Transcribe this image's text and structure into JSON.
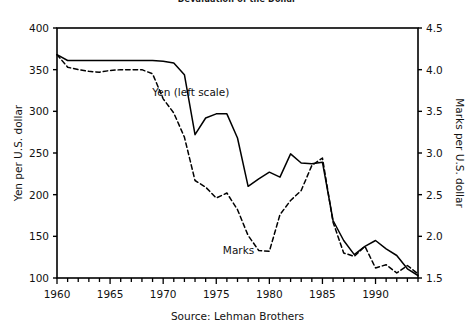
{
  "chart_data": {
    "type": "line",
    "title": "Devaluation of the Dollar",
    "source": "Source: Lehman Brothers",
    "xlabel": "",
    "xlim": [
      1960,
      1994
    ],
    "xticks": [
      1960,
      1965,
      1970,
      1975,
      1980,
      1985,
      1990
    ],
    "xtick_labels": [
      "1960",
      "1965",
      "1970",
      "1975",
      "1980",
      "1985",
      "1990"
    ],
    "minor_xtick_step": 1,
    "grid": false,
    "legend_position": "inline-annotations",
    "left_axis": {
      "label": "Yen per U.S. dollar",
      "ylim": [
        100,
        400
      ],
      "yticks": [
        100,
        150,
        200,
        250,
        300,
        350,
        400
      ],
      "ytick_labels": [
        "100",
        "150",
        "200",
        "250",
        "300",
        "350",
        "400"
      ]
    },
    "right_axis": {
      "label": "Marks per U.S. dollar",
      "ylim": [
        1.5,
        4.5
      ],
      "yticks": [
        1.5,
        2.0,
        2.5,
        3.0,
        3.5,
        4.0,
        4.5
      ],
      "ytick_labels": [
        "1.5",
        "2.0",
        "2.5",
        "3.0",
        "3.5",
        "4.0",
        "4.5"
      ]
    },
    "series": [
      {
        "name": "Yen (left scale)",
        "axis": "left",
        "style": "solid",
        "color": "#000000",
        "annotation": "Yen (left scale)",
        "annotation_x": 1972.6,
        "annotation_y": 318,
        "x": [
          1960,
          1961,
          1962,
          1963,
          1964,
          1965,
          1966,
          1967,
          1968,
          1969,
          1970,
          1971,
          1972,
          1973,
          1974,
          1975,
          1976,
          1977,
          1978,
          1979,
          1980,
          1981,
          1982,
          1983,
          1984,
          1985,
          1986,
          1987,
          1988,
          1989,
          1990,
          1991,
          1992,
          1993,
          1994
        ],
        "values": [
          368,
          361,
          361,
          361,
          361,
          361,
          361,
          361,
          361,
          361,
          360,
          358,
          344,
          272,
          292,
          297,
          297,
          268,
          210,
          219,
          227,
          221,
          249,
          238,
          237,
          239,
          169,
          145,
          128,
          138,
          145,
          135,
          127,
          111,
          103
        ]
      },
      {
        "name": "Marks",
        "axis": "right",
        "style": "dashed",
        "color": "#000000",
        "annotation": "Marks",
        "annotation_x": 1977.1,
        "annotation_y": 1.79,
        "x": [
          1960,
          1961,
          1962,
          1963,
          1964,
          1965,
          1966,
          1967,
          1968,
          1969,
          1970,
          1971,
          1972,
          1973,
          1974,
          1975,
          1976,
          1977,
          1978,
          1979,
          1980,
          1981,
          1982,
          1983,
          1984,
          1985,
          1986,
          1987,
          1988,
          1989,
          1990,
          1991,
          1992,
          1993,
          1994
        ],
        "values": [
          4.18,
          4.03,
          4.0,
          3.98,
          3.97,
          3.99,
          4.0,
          4.0,
          4.0,
          3.95,
          3.65,
          3.48,
          3.19,
          2.67,
          2.59,
          2.46,
          2.52,
          2.32,
          2.01,
          1.83,
          1.82,
          2.26,
          2.43,
          2.55,
          2.85,
          2.94,
          2.17,
          1.8,
          1.76,
          1.88,
          1.62,
          1.66,
          1.56,
          1.65,
          1.55
        ]
      }
    ]
  }
}
